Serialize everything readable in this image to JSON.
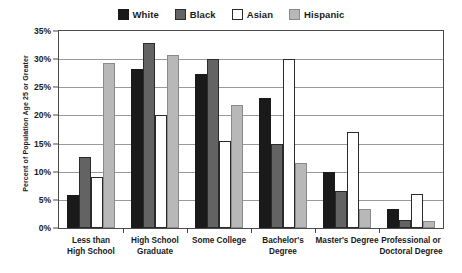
{
  "chart_data": {
    "type": "bar",
    "title": "",
    "xlabel": "",
    "ylabel": "Percent of Population Age 25 or Greater",
    "ylim": [
      0,
      35
    ],
    "ytick_labels": [
      "0%",
      "5%",
      "10%",
      "15%",
      "20%",
      "25%",
      "30%",
      "35%"
    ],
    "ytick_values": [
      0,
      5,
      10,
      15,
      20,
      25,
      30,
      35
    ],
    "grid": true,
    "legend_position": "top-center",
    "categories": [
      "Less than High School",
      "High School Graduate",
      "Some College",
      "Bachelor's Degree",
      "Master's Degree",
      "Professional or Doctoral Degree"
    ],
    "category_lines": [
      [
        "Less than",
        "High School"
      ],
      [
        "High School",
        "Graduate"
      ],
      [
        "Some College"
      ],
      [
        "Bachelor's",
        "Degree"
      ],
      [
        "Master's Degree"
      ],
      [
        "Professional or",
        "Doctoral Degree"
      ]
    ],
    "series": [
      {
        "name": "White",
        "color": "#1a1a1a",
        "border": "#1a1a1a",
        "values": [
          5.8,
          28.3,
          27.4,
          23.1,
          9.9,
          3.3
        ]
      },
      {
        "name": "Black",
        "color": "#636363",
        "border": "#2b2b2b",
        "values": [
          12.6,
          32.9,
          30.1,
          14.9,
          6.5,
          1.5
        ]
      },
      {
        "name": "Asian",
        "color": "#ffffff",
        "border": "#2b2b2b",
        "values": [
          9.0,
          20.0,
          15.5,
          30.0,
          17.1,
          6.0
        ]
      },
      {
        "name": "Hispanic",
        "color": "#b8b8b8",
        "border": "#8a8a8a",
        "values": [
          29.3,
          30.7,
          21.9,
          11.6,
          3.4,
          1.2
        ]
      }
    ]
  }
}
